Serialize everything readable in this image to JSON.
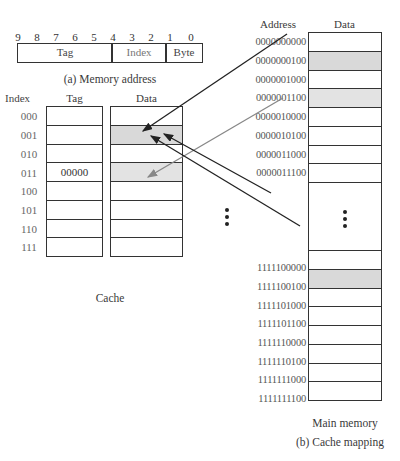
{
  "memory_address": {
    "bit_numbers": [
      "9",
      "8",
      "7",
      "6",
      "5",
      "4",
      "3",
      "2",
      "1",
      "0"
    ],
    "fields": [
      {
        "label": "Tag",
        "bits": "9-5"
      },
      {
        "label": "Index",
        "bits": "4-2"
      },
      {
        "label": "Byte",
        "bits": "1-0"
      }
    ],
    "caption": "(a) Memory address"
  },
  "cache": {
    "headers": {
      "index": "Index",
      "tag": "Tag",
      "data": "Data"
    },
    "rows": [
      {
        "index": "000",
        "tag": "",
        "shaded": false
      },
      {
        "index": "001",
        "tag": "",
        "shaded": true
      },
      {
        "index": "010",
        "tag": "",
        "shaded": false
      },
      {
        "index": "011",
        "tag": "00000",
        "shaded": true
      },
      {
        "index": "100",
        "tag": "",
        "shaded": false
      },
      {
        "index": "101",
        "tag": "",
        "shaded": false
      },
      {
        "index": "110",
        "tag": "",
        "shaded": false
      },
      {
        "index": "111",
        "tag": "",
        "shaded": false
      }
    ],
    "caption": "Cache"
  },
  "main_memory": {
    "headers": {
      "address": "Address",
      "data": "Data"
    },
    "top_rows": [
      {
        "address": "0000000000",
        "shaded": false
      },
      {
        "address": "0000000100",
        "shaded": true
      },
      {
        "address": "0000001000",
        "shaded": false
      },
      {
        "address": "0000001100",
        "shaded": true
      },
      {
        "address": "0000010000",
        "shaded": false
      },
      {
        "address": "0000010100",
        "shaded": false
      },
      {
        "address": "0000011000",
        "shaded": false
      },
      {
        "address": "0000011100",
        "shaded": false
      }
    ],
    "ellipsis": "⋮",
    "bottom_rows": [
      {
        "address": "1111100000",
        "shaded": false
      },
      {
        "address": "1111100100",
        "shaded": true
      },
      {
        "address": "1111101000",
        "shaded": false
      },
      {
        "address": "1111101100",
        "shaded": false
      },
      {
        "address": "1111110000",
        "shaded": false
      },
      {
        "address": "1111110100",
        "shaded": false
      },
      {
        "address": "1111111000",
        "shaded": false
      },
      {
        "address": "1111111100",
        "shaded": false
      }
    ],
    "caption": "Main memory"
  },
  "figure_caption": "(b) Cache mapping",
  "arrows": [
    {
      "from": "0000000100",
      "to": "cache-001",
      "color": "#222222"
    },
    {
      "from": "0000001100",
      "to": "cache-011",
      "color": "#888888"
    },
    {
      "from": "0000011100+",
      "to": "cache-001",
      "color": "#222222"
    },
    {
      "from": "1111100100",
      "to": "cache-001",
      "color": "#222222"
    }
  ]
}
